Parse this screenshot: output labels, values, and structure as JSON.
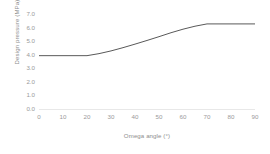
{
  "chart_data": {
    "type": "line",
    "title": "",
    "xlabel": "Omega angle (°)",
    "ylabel": "Design pressure (MPa)",
    "xlim": [
      0,
      90
    ],
    "ylim": [
      0.0,
      7.0
    ],
    "xticks": [
      "0",
      "10",
      "20",
      "30",
      "40",
      "50",
      "60",
      "70",
      "80",
      "90"
    ],
    "xtick_values": [
      0,
      10,
      20,
      30,
      40,
      50,
      60,
      70,
      80,
      90
    ],
    "yticks": [
      "0.0",
      "1.0",
      "2.0",
      "3.0",
      "4.0",
      "5.0",
      "6.0",
      "7.0"
    ],
    "ytick_values": [
      0.0,
      1.0,
      2.0,
      3.0,
      4.0,
      5.0,
      6.0,
      7.0
    ],
    "grid": false,
    "legend": false,
    "legend_position": "none",
    "line_color": "#595959",
    "line_width": 1.0,
    "background_color": "#ffffff",
    "tick_label_color": "#9a9a9a",
    "axis_title_color": "#8c8c8c",
    "axis_line_color": "#e8e8e8",
    "series": [
      {
        "name": "Design pressure",
        "x": [
          0,
          5,
          10,
          15,
          20,
          25,
          30,
          35,
          40,
          45,
          50,
          55,
          60,
          65,
          70,
          75,
          80,
          85,
          90
        ],
        "values": [
          3.93,
          3.93,
          3.93,
          3.93,
          3.93,
          4.08,
          4.28,
          4.52,
          4.78,
          5.05,
          5.33,
          5.62,
          5.88,
          6.1,
          6.27,
          6.27,
          6.27,
          6.27,
          6.27
        ]
      }
    ],
    "annotations": [
      {
        "label": "left plateau",
        "x_range": [
          0,
          20
        ],
        "value": 3.93
      },
      {
        "label": "right plateau",
        "x_range": [
          70,
          90
        ],
        "value": 6.27
      }
    ]
  }
}
